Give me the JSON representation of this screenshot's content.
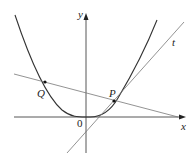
{
  "diagram": {
    "type": "function-graph",
    "colors": {
      "curve": "#333333",
      "axes": "#444444",
      "tangent": "#777777",
      "secant": "#777777",
      "points": "#111111",
      "background": "#ffffff"
    },
    "axes": {
      "x_label": "x",
      "y_label": "y",
      "origin_label": "0"
    },
    "points": [
      {
        "label": "Q",
        "on": "curve"
      },
      {
        "label": "P",
        "on": "curve"
      }
    ],
    "lines": [
      {
        "label": "t",
        "kind": "tangent at P"
      },
      {
        "label": "",
        "kind": "secant through Q and P"
      }
    ]
  }
}
